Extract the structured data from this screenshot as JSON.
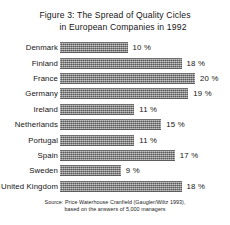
{
  "title": {
    "line1": "Figure 3: The Spread of Quality Cicles",
    "line2": "in European Companies in 1992"
  },
  "source": {
    "line1": "Source: Price Waterhouse Cranfield (Gaugler/Wiltz 1993),",
    "line2": "based on the answers of 5,000 managers"
  },
  "chart_data": {
    "type": "bar",
    "orientation": "horizontal",
    "title": "Figure 3: The Spread of Quality Cicles in European Companies in 1992",
    "xlabel": "",
    "ylabel": "",
    "xlim": [
      0,
      20
    ],
    "grid": false,
    "legend": false,
    "unit": "%",
    "categories": [
      "Denmark",
      "Finland",
      "France",
      "Germany",
      "Ireland",
      "Netherlands",
      "Portugal",
      "Spain",
      "Sweden",
      "United Kingdom"
    ],
    "values": [
      10,
      18,
      20,
      19,
      11,
      15,
      11,
      17,
      9,
      18
    ],
    "value_labels": [
      "10 %",
      "18 %",
      "20 %",
      "19 %",
      "11 %",
      "15 %",
      "11 %",
      "17 %",
      "9 %",
      "18 %"
    ],
    "bar_color": "#8d8d8d"
  }
}
